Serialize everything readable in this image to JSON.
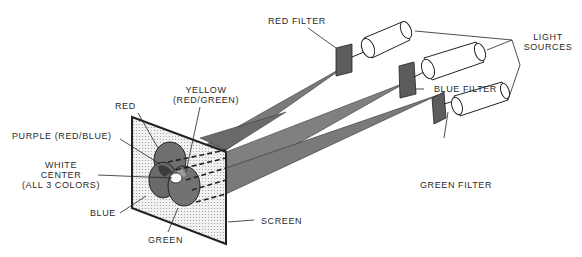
{
  "diagram": {
    "type": "additive-color-mixing-illustration",
    "labels": {
      "red_filter": "RED FILTER",
      "blue_filter": "BLUE FILTER",
      "green_filter": "GREEN FILTER",
      "light_sources_1": "LIGHT",
      "light_sources_2": "SOURCES",
      "yellow_1": "YELLOW",
      "yellow_2": "(RED/GREEN)",
      "red": "RED",
      "purple": "PURPLE (RED/BLUE)",
      "white_1": "WHITE",
      "white_2": "CENTER",
      "white_3": "(ALL 3 COLORS)",
      "blue": "BLUE",
      "green": "GREEN",
      "screen": "SCREEN"
    },
    "colors": {
      "line": "#222222",
      "beam": "#7a7a7a",
      "filter": "#5c5c5c",
      "screen_fill": "#ececec",
      "circle": "#6e6e6e",
      "overlap_dark": "#3c3c3c",
      "white_center": "#ffffff"
    }
  }
}
